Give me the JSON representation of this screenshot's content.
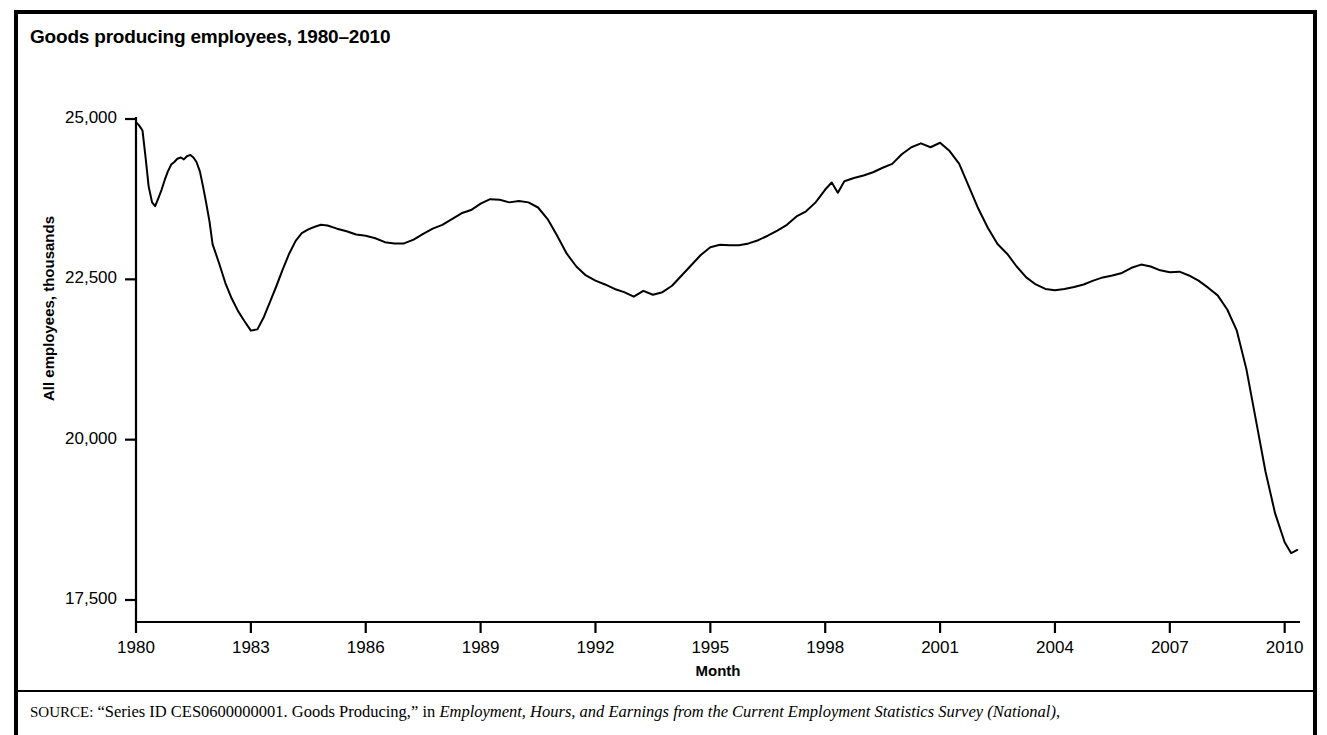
{
  "figure": {
    "title": "Goods producing employees, 1980–2010",
    "source_prefix": "SOURCE:",
    "source_plain_1": " “Series ID CES0600000001. Goods Producing,” in ",
    "source_italic": "Employment, Hours, and Earnings from the Current Employment Statistics Survey (National)",
    "source_plain_2": ","
  },
  "chart_data": {
    "type": "line",
    "title": "Goods producing employees, 1980–2010",
    "xlabel": "Month",
    "ylabel": "All employees, thousands",
    "xlim": [
      1980,
      2010.4
    ],
    "ylim": [
      17500,
      25000
    ],
    "grid": false,
    "legend": null,
    "line_color": "#000000",
    "xticks": [
      "1980",
      "1983",
      "1986",
      "1989",
      "1992",
      "1995",
      "1998",
      "2001",
      "2004",
      "2007",
      "2010"
    ],
    "xtick_values": [
      1980,
      1983,
      1986,
      1989,
      1992,
      1995,
      1998,
      2001,
      2004,
      2007,
      2010
    ],
    "yticks": [
      "17,500",
      "20,000",
      "22,500",
      "25,000"
    ],
    "ytick_values": [
      17500,
      20000,
      22500,
      25000
    ],
    "series": [
      {
        "name": "Goods Producing (CES0600000001)",
        "x": [
          1980.0,
          1980.08,
          1980.17,
          1980.25,
          1980.33,
          1980.42,
          1980.5,
          1980.58,
          1980.67,
          1980.75,
          1980.83,
          1980.92,
          1981.0,
          1981.08,
          1981.17,
          1981.25,
          1981.33,
          1981.42,
          1981.5,
          1981.58,
          1981.67,
          1981.75,
          1981.83,
          1981.92,
          1982.0,
          1982.17,
          1982.33,
          1982.5,
          1982.67,
          1982.83,
          1983.0,
          1983.17,
          1983.33,
          1983.5,
          1983.67,
          1983.83,
          1984.0,
          1984.17,
          1984.33,
          1984.5,
          1984.67,
          1984.83,
          1985.0,
          1985.25,
          1985.5,
          1985.75,
          1986.0,
          1986.25,
          1986.5,
          1986.75,
          1987.0,
          1987.25,
          1987.5,
          1987.75,
          1988.0,
          1988.25,
          1988.5,
          1988.75,
          1989.0,
          1989.25,
          1989.5,
          1989.75,
          1990.0,
          1990.25,
          1990.5,
          1990.75,
          1991.0,
          1991.25,
          1991.5,
          1991.75,
          1992.0,
          1992.25,
          1992.5,
          1992.75,
          1993.0,
          1993.25,
          1993.5,
          1993.75,
          1994.0,
          1994.25,
          1994.5,
          1994.75,
          1995.0,
          1995.25,
          1995.5,
          1995.75,
          1996.0,
          1996.25,
          1996.5,
          1996.75,
          1997.0,
          1997.25,
          1997.5,
          1997.75,
          1998.0,
          1998.17,
          1998.33,
          1998.5,
          1998.75,
          1999.0,
          1999.25,
          1999.5,
          1999.75,
          2000.0,
          2000.25,
          2000.5,
          2000.75,
          2001.0,
          2001.25,
          2001.5,
          2001.75,
          2002.0,
          2002.25,
          2002.5,
          2002.75,
          2003.0,
          2003.25,
          2003.5,
          2003.75,
          2004.0,
          2004.25,
          2004.5,
          2004.75,
          2005.0,
          2005.25,
          2005.5,
          2005.75,
          2006.0,
          2006.25,
          2006.5,
          2006.75,
          2007.0,
          2007.25,
          2007.5,
          2007.75,
          2008.0,
          2008.25,
          2008.5,
          2008.75,
          2009.0,
          2009.25,
          2009.5,
          2009.75,
          2010.0,
          2010.17,
          2010.33
        ],
        "y": [
          24950,
          24900,
          24820,
          24400,
          23950,
          23700,
          23640,
          23760,
          23900,
          24050,
          24180,
          24290,
          24330,
          24380,
          24400,
          24370,
          24420,
          24440,
          24400,
          24330,
          24180,
          23950,
          23700,
          23400,
          23050,
          22750,
          22450,
          22200,
          22000,
          21850,
          21700,
          21720,
          21900,
          22150,
          22400,
          22650,
          22900,
          23100,
          23220,
          23280,
          23320,
          23350,
          23340,
          23290,
          23250,
          23200,
          23180,
          23140,
          23080,
          23060,
          23060,
          23120,
          23210,
          23290,
          23350,
          23440,
          23530,
          23580,
          23680,
          23750,
          23740,
          23700,
          23720,
          23700,
          23620,
          23440,
          23180,
          22900,
          22700,
          22560,
          22480,
          22420,
          22350,
          22300,
          22230,
          22320,
          22260,
          22300,
          22400,
          22560,
          22720,
          22880,
          23000,
          23040,
          23030,
          23030,
          23060,
          23110,
          23180,
          23260,
          23350,
          23480,
          23560,
          23700,
          23900,
          24010,
          23850,
          24030,
          24080,
          24120,
          24170,
          24240,
          24300,
          24450,
          24560,
          24620,
          24560,
          24630,
          24500,
          24300,
          23950,
          23600,
          23300,
          23050,
          22900,
          22700,
          22530,
          22420,
          22350,
          22330,
          22350,
          22380,
          22420,
          22480,
          22530,
          22560,
          22600,
          22680,
          22730,
          22700,
          22640,
          22610,
          22620,
          22560,
          22480,
          22370,
          22250,
          22030,
          21700,
          21100,
          20300,
          19500,
          18850,
          18400,
          18230,
          18280
        ]
      }
    ],
    "annotations": []
  }
}
